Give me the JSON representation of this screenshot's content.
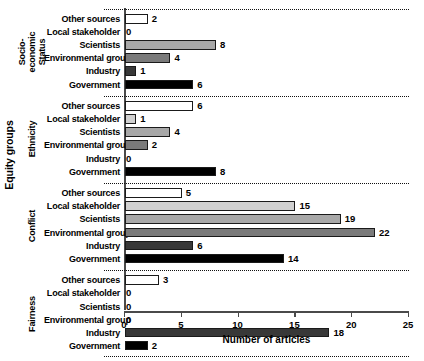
{
  "chart_data": {
    "type": "bar",
    "orientation": "horizontal",
    "title": "",
    "xlabel": "Number of articles",
    "ylabel": "Equity groups",
    "xlim": [
      0,
      25
    ],
    "xticks": [
      0,
      5,
      10,
      15,
      20,
      25
    ],
    "grid": false,
    "legend": "none",
    "categories": [
      "Other sources",
      "Local stakeholder",
      "Scientists",
      "Environmental group",
      "Industry",
      "Government"
    ],
    "category_colors": [
      "#ffffff",
      "#d0d0d0",
      "#a8a8a8",
      "#7a7a7a",
      "#383838",
      "#000000"
    ],
    "groups": [
      {
        "name": "Socio-economic Status",
        "name_lines": [
          "Socio-economic",
          "Status"
        ],
        "values": [
          2,
          0,
          8,
          4,
          1,
          6
        ]
      },
      {
        "name": "Ethnicity",
        "name_lines": [
          "Ethnicity"
        ],
        "values": [
          6,
          1,
          4,
          2,
          0,
          8
        ]
      },
      {
        "name": "Conflict",
        "name_lines": [
          "Conflict"
        ],
        "values": [
          5,
          15,
          19,
          22,
          6,
          14
        ]
      },
      {
        "name": "Fairness",
        "name_lines": [
          "Fairness"
        ],
        "values": [
          3,
          0,
          0,
          0,
          18,
          2
        ]
      }
    ]
  }
}
